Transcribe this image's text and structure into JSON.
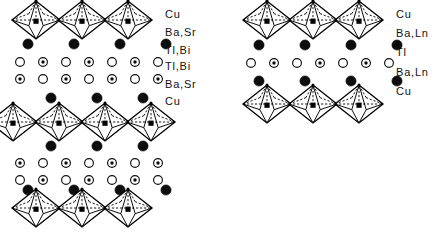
{
  "figure": {
    "background_color": "#ffffff",
    "ink_color": "#000000"
  },
  "panels": [
    {
      "id": "left-panel",
      "name": "tl-bi-double-layer-structure",
      "labels": [
        {
          "text": "Cu",
          "y": 14
        },
        {
          "text": "Ba,Sr",
          "y": 32
        },
        {
          "text": "Tl,Bi",
          "y": 50
        },
        {
          "text": "Tl,Bi",
          "y": 66
        },
        {
          "text": "Ba,Sr",
          "y": 84
        },
        {
          "text": "Cu",
          "y": 101
        }
      ],
      "label_x": 165,
      "octahedra_rows": [
        {
          "name": "cu-octahedra-row-top",
          "cy": 20,
          "start_x": 36,
          "count": 3,
          "pitch": 46
        },
        {
          "name": "cu-octahedra-row-middle",
          "cy": 122,
          "start_x": 13,
          "count": 4,
          "pitch": 46
        },
        {
          "name": "cu-octahedra-row-bottom",
          "cy": 208,
          "start_x": 36,
          "count": 3,
          "pitch": 46
        }
      ],
      "atom_rows": [
        {
          "name": "ba-sr-row-1",
          "type": "filled",
          "cy": 44,
          "start_x": 28,
          "count": 4,
          "pitch": 46
        },
        {
          "name": "tl-bi-row-1",
          "type": "alternating",
          "cy": 62,
          "start_x": 20,
          "count": 7,
          "pitch": 23,
          "first": "open"
        },
        {
          "name": "tl-bi-row-2",
          "type": "alternating",
          "cy": 79,
          "start_x": 20,
          "count": 7,
          "pitch": 23,
          "first": "dotted"
        },
        {
          "name": "ba-sr-row-2",
          "type": "filled",
          "cy": 98,
          "start_x": 51,
          "count": 3,
          "pitch": 46
        },
        {
          "name": "ba-sr-row-3",
          "type": "filled",
          "cy": 146,
          "start_x": 51,
          "count": 3,
          "pitch": 46
        },
        {
          "name": "tl-bi-row-3",
          "type": "alternating",
          "cy": 163,
          "start_x": 20,
          "count": 7,
          "pitch": 23,
          "first": "dotted"
        },
        {
          "name": "tl-bi-row-4",
          "type": "alternating",
          "cy": 180,
          "start_x": 20,
          "count": 7,
          "pitch": 23,
          "first": "open"
        },
        {
          "name": "ba-sr-row-4",
          "type": "filled",
          "cy": 190,
          "start_x": 28,
          "count": 4,
          "pitch": 46
        }
      ]
    },
    {
      "id": "right-panel",
      "name": "tl-single-layer-structure",
      "labels": [
        {
          "text": "Cu",
          "y": 14
        },
        {
          "text": "Ba,Ln",
          "y": 33
        },
        {
          "text": "Tl",
          "y": 52
        },
        {
          "text": "Ba,Ln",
          "y": 72
        },
        {
          "text": "Cu",
          "y": 91
        }
      ],
      "label_x": 396,
      "octahedra_rows": [
        {
          "name": "cu-octahedra-row-top",
          "cy": 20,
          "start_x": 267,
          "count": 3,
          "pitch": 46
        },
        {
          "name": "cu-octahedra-row-bottom",
          "cy": 104,
          "start_x": 267,
          "count": 3,
          "pitch": 46
        }
      ],
      "atom_rows": [
        {
          "name": "ba-ln-row-top",
          "type": "filled",
          "cy": 45,
          "start_x": 259,
          "count": 4,
          "pitch": 46
        },
        {
          "name": "tl-row",
          "type": "alternating",
          "cy": 63,
          "start_x": 251,
          "count": 7,
          "pitch": 23,
          "first": "open"
        },
        {
          "name": "ba-ln-row-bottom",
          "type": "filled",
          "cy": 81,
          "start_x": 259,
          "count": 4,
          "pitch": 46
        }
      ]
    }
  ],
  "geometry": {
    "octahedron": {
      "half_width": 24,
      "half_height": 19,
      "center_square": 2.6
    },
    "atom_radius_filled": 5.1,
    "atom_radius_open": 4.4,
    "atom_dot_radius": 1.7
  }
}
